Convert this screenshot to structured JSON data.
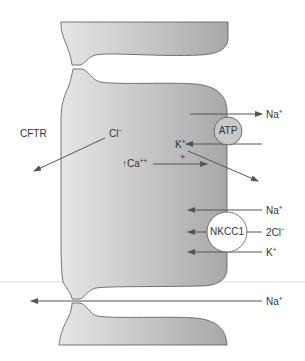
{
  "diagram": {
    "type": "epithelial-cell-ion-transport",
    "colors": {
      "cell_fill_dark": "#a8a8a8",
      "cell_fill_light": "#e6e6e6",
      "cell_outline": "#555555",
      "arrow": "#555555",
      "transporter_fill": "#c8c8c8",
      "nkcc1_fill": "#ffffff",
      "basement_line": "#dddddd"
    },
    "labels": {
      "cftr": "CFTR",
      "cl": {
        "base": "Cl",
        "sup": "−"
      },
      "ca": {
        "prefix": "↑Ca",
        "sup": "++"
      },
      "plus": "+",
      "k_inside": {
        "base": "K",
        "sup": "+"
      },
      "na_top": {
        "base": "Na",
        "sup": "+"
      },
      "na_nkcc": {
        "base": "Na",
        "sup": "+"
      },
      "cl2_nkcc": {
        "base": "2Cl",
        "sup": "−"
      },
      "k_nkcc": {
        "base": "K",
        "sup": "+"
      },
      "na_paracellular": {
        "base": "Na",
        "sup": "+"
      }
    },
    "transporters": {
      "atp": "ATP",
      "nkcc1": "NKCC1"
    }
  }
}
